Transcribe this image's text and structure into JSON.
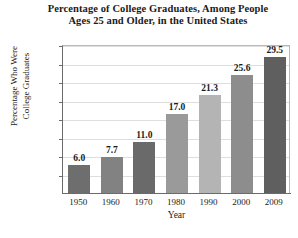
{
  "chart_data": {
    "type": "bar",
    "title": "Percentage of College Graduates, Among People Ages 25 and Older, in the United States",
    "title_lines": [
      "Percentage of College Graduates, Among People",
      "Ages 25 and Older, in the United States"
    ],
    "xlabel": "Year",
    "ylabel": "Percentage Who Were College Graduates",
    "ylabel_lines": [
      "Percentage Who Were",
      "College Graduates"
    ],
    "categories": [
      "1950",
      "1960",
      "1970",
      "1980",
      "1990",
      "2000",
      "2009"
    ],
    "values": [
      6.0,
      7.7,
      11.0,
      17.0,
      21.3,
      25.6,
      29.5
    ],
    "value_labels": [
      "6.0",
      "7.7",
      "11.0",
      "17.0",
      "21.3",
      "25.6",
      "29.5"
    ],
    "bar_colors": [
      "#6e6e6e",
      "#828282",
      "#6a6a6a",
      "#9a9a9a",
      "#b4b4b4",
      "#8d8d8d",
      "#5f5f5f"
    ],
    "ylim": [
      0,
      32
    ],
    "yticks": [
      4,
      8,
      12,
      16,
      20,
      24,
      28,
      32
    ],
    "ytick_labels": [
      "4%",
      "8%",
      "12%",
      "16%",
      "20%",
      "24%",
      "28%",
      "32%"
    ],
    "grid": true,
    "legend": "none",
    "axis_color": "#6b6b6b",
    "grid_color": "#dedede"
  }
}
